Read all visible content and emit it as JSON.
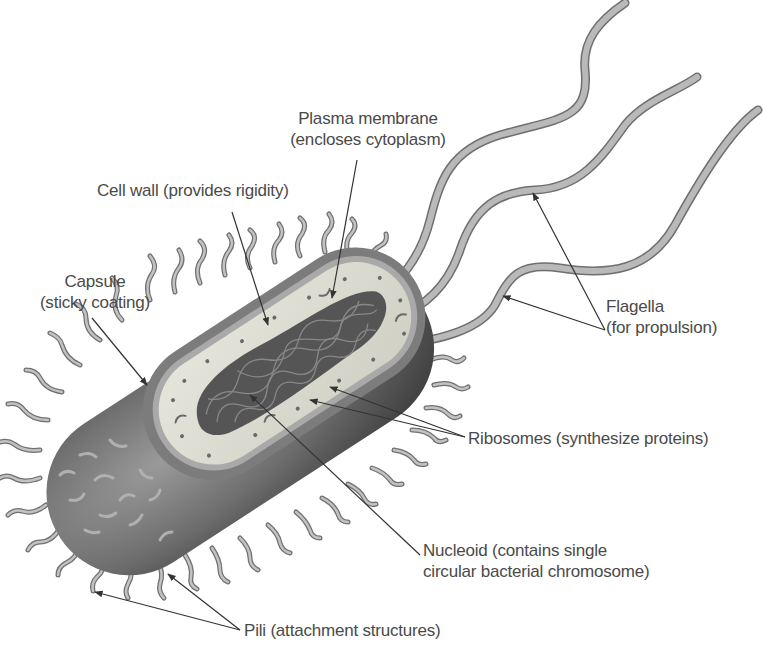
{
  "diagram": {
    "colors": {
      "background": "#ffffff",
      "label_text": "#4a4a4a",
      "leader_line": "#333333",
      "capsule_dark": "#5a5a5a",
      "cell_wall": "#8a8a8a",
      "cytoplasm": "#dcdcd2",
      "nucleoid": "#4f4f4f",
      "appendage": "#a8a8a8"
    },
    "labels": {
      "plasma_membrane": {
        "line1": "Plasma membrane",
        "line2": "(encloses cytoplasm)"
      },
      "cell_wall": {
        "line1": "Cell wall (provides rigidity)"
      },
      "capsule": {
        "line1": "Capsule",
        "line2": "(sticky coating)"
      },
      "flagella": {
        "line1": "Flagella",
        "line2": "(for propulsion)"
      },
      "ribosomes": {
        "line1": "Ribosomes (synthesize proteins)"
      },
      "nucleoid": {
        "line1": "Nucleoid (contains single",
        "line2": "circular bacterial chromosome)"
      },
      "pili": {
        "line1": "Pili (attachment structures)"
      }
    },
    "structures": [
      "capsule-icon",
      "cell-wall-icon",
      "plasma-membrane-icon",
      "cytoplasm-icon",
      "nucleoid-icon",
      "ribosome-icon",
      "flagellum-icon",
      "pilus-icon"
    ]
  }
}
